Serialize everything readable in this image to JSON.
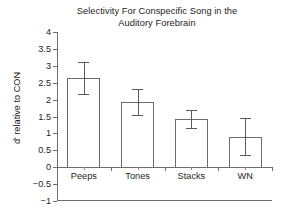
{
  "chart_data": {
    "type": "bar",
    "title": "Selectivity For Conspecific Song in the Auditory Forebrain",
    "title_lines": [
      "Selectivity For Conspecific Song in the",
      "Auditory Forebrain"
    ],
    "xlabel": "",
    "ylabel": "d' relative to CON",
    "ylim": [
      -1,
      4
    ],
    "grid": false,
    "legend": false,
    "categories": [
      "Peeps",
      "Tones",
      "Stacks",
      "WN"
    ],
    "values": [
      2.65,
      1.93,
      1.42,
      0.89
    ],
    "errors_lower": [
      0.47,
      0.38,
      0.27,
      0.54
    ],
    "errors_upper": [
      0.47,
      0.38,
      0.26,
      0.56
    ],
    "error_low_values": [
      2.18,
      1.55,
      1.15,
      0.35
    ],
    "error_high_values": [
      3.12,
      2.31,
      1.68,
      1.45
    ],
    "ytick_labels": [
      "4",
      "3.5",
      "3",
      "2.5",
      "2",
      "1.5",
      "1",
      "0.5",
      "0",
      "−0.5",
      "−1"
    ],
    "ytick_values": [
      4,
      3.5,
      3,
      2.5,
      2,
      1.5,
      1,
      0.5,
      0,
      -0.5,
      -1
    ],
    "bar_facecolor": "#ffffff",
    "bar_edgecolor": "#6d6d6d",
    "axis_color": "#6d6d6d",
    "text_color": "#1e1e1e",
    "background": "#ffffff"
  }
}
